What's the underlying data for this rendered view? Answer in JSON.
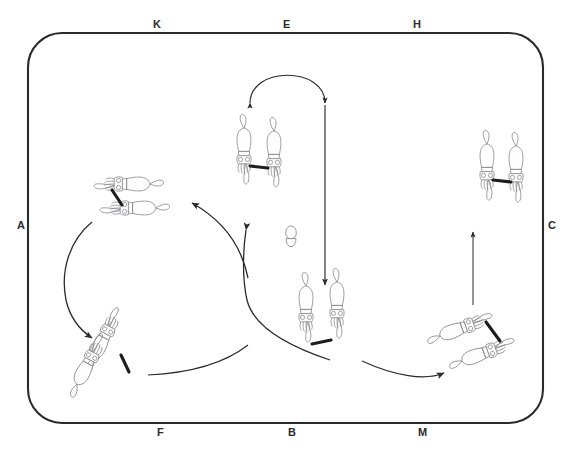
{
  "figure": {
    "background_color": "#ffffff",
    "line_color": "#2b2b2b",
    "sketch_color": "#8a8a8f",
    "frame": {
      "x": 28,
      "y": 33,
      "width": 515,
      "height": 390,
      "corner_radius": 34,
      "stroke_width": 2.1
    }
  },
  "labels": {
    "top": [
      {
        "id": "K",
        "text": "K",
        "x": 158,
        "y": 24
      },
      {
        "id": "E",
        "text": "E",
        "x": 288,
        "y": 24
      },
      {
        "id": "H",
        "text": "H",
        "x": 418,
        "y": 24
      }
    ],
    "left": [
      {
        "id": "A",
        "text": "A",
        "x": 20,
        "y": 225
      }
    ],
    "right": [
      {
        "id": "C",
        "text": "C",
        "x": 551,
        "y": 225
      }
    ],
    "bottom": [
      {
        "id": "F",
        "text": "F",
        "x": 162,
        "y": 432
      },
      {
        "id": "B",
        "text": "B",
        "x": 293,
        "y": 432
      },
      {
        "id": "M",
        "text": "M",
        "x": 423,
        "y": 432
      }
    ]
  },
  "squid_groups": [
    {
      "name": "top-center-pair",
      "label_ref": "E",
      "count": 2,
      "orientation": "vertical-head-down",
      "center": {
        "x": 262,
        "y": 175
      },
      "note": "Pair of squid hanging head-down, joined by a dark arm-link between them"
    },
    {
      "name": "top-right-pair",
      "label_ref": "H",
      "count": 2,
      "orientation": "vertical-head-down",
      "center": {
        "x": 501,
        "y": 190
      },
      "note": "Pair of squid hanging head-down, joined by a dark arm-link"
    },
    {
      "name": "upper-left-pair",
      "label_ref": "K",
      "count": 2,
      "orientation": "horizontal-facing-left",
      "center": {
        "x": 136,
        "y": 198
      },
      "note": "Two squid lying horizontally, heads to the left, dark connecting line"
    },
    {
      "name": "lower-left-pair",
      "label_ref": "F",
      "count": 2,
      "orientation": "diagonal-head-lower-right",
      "center": {
        "x": 110,
        "y": 345
      },
      "note": "Two squid angled down-right with spread tentacles"
    },
    {
      "name": "bottom-center-pair",
      "label_ref": "B",
      "count": 2,
      "orientation": "vertical-head-down",
      "center": {
        "x": 322,
        "y": 330
      },
      "note": "Two squid pointing downward, tentacles fanned out"
    },
    {
      "name": "bottom-right-pair",
      "label_ref": "M",
      "count": 2,
      "orientation": "diagonal-head-upper-right",
      "center": {
        "x": 483,
        "y": 337
      },
      "note": "Two squid angled up-right, dark arm-link between them"
    }
  ],
  "egg_object": {
    "name": "egg-capsule",
    "center": {
      "x": 291,
      "y": 237
    },
    "width": 13,
    "height": 23,
    "note": "Small egg / spermatophore capsule drawn at the centre of the cycle"
  },
  "arrows": [
    {
      "id": "arc-top-bidirectional",
      "from": "top-center-pair",
      "to": "top-center-pair",
      "style": "arc",
      "heads": "both",
      "note": "Semicircular arc above the top-centre pair with arrowheads at both ends"
    },
    {
      "id": "left-down-arc",
      "from": "upper-left-pair",
      "to": "lower-left-pair",
      "style": "curve",
      "heads": "end"
    },
    {
      "id": "bottom-left-to-right-curve",
      "from": "lower-left-pair",
      "to": "bottom-center-right",
      "style": "curve",
      "heads": "none"
    },
    {
      "id": "right-up-to-center-pair",
      "from": "bottom-area",
      "to": "top-center-pair",
      "style": "curve",
      "heads": "end"
    },
    {
      "id": "into-upper-left-pair",
      "from": "right-side",
      "to": "upper-left-pair",
      "style": "curve",
      "heads": "end"
    },
    {
      "id": "center-vertical-down",
      "from": "top-center-pair",
      "to": "bottom-center-pair",
      "style": "straight",
      "heads": "end"
    },
    {
      "id": "bottom-to-bottom-right",
      "from": "bottom-center-pair",
      "to": "bottom-right-pair",
      "style": "curve",
      "heads": "end"
    },
    {
      "id": "right-vertical-up",
      "from": "bottom-right-pair",
      "to": "top-right-pair",
      "style": "straight",
      "heads": "end"
    }
  ]
}
